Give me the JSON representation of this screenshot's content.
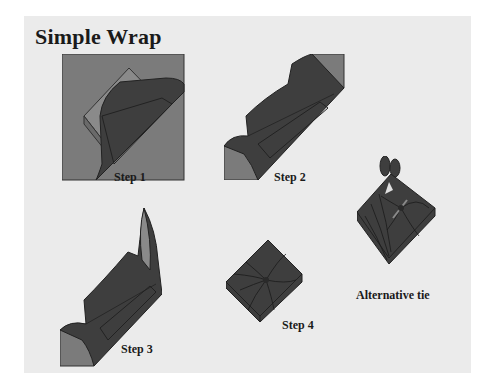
{
  "title": "Simple Wrap",
  "steps": [
    {
      "label": "Step 1"
    },
    {
      "label": "Step 2"
    },
    {
      "label": "Step 3"
    },
    {
      "label": "Step 4"
    }
  ],
  "alternative": {
    "label": "Alternative tie"
  },
  "colors": {
    "background": "#ebebeb",
    "cloth_light": "#7b7b7b",
    "cloth_dark": "#3e3e3e",
    "outline": "#222222"
  }
}
